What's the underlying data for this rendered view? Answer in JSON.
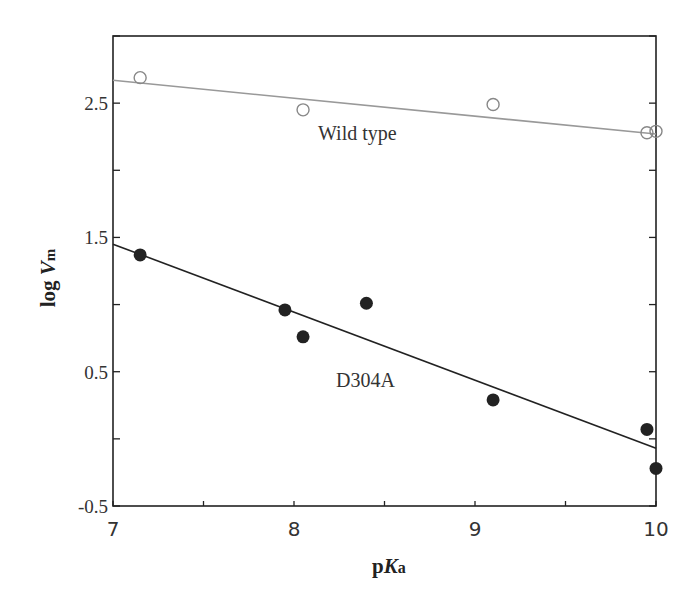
{
  "chart_data": {
    "type": "scatter",
    "title": "",
    "xlabel": "pKa",
    "ylabel": "log Vm",
    "xlim": [
      7,
      10
    ],
    "ylim": [
      -0.5,
      3.0
    ],
    "x_ticks": [
      7,
      8,
      9,
      10
    ],
    "x_tick_labels": [
      "7",
      "8",
      "9",
      "10"
    ],
    "y_ticks": [
      -0.5,
      0.5,
      1.5,
      2.5
    ],
    "y_tick_labels": [
      "-0.5",
      "0.5",
      "1.5",
      "2.5"
    ],
    "grid": false,
    "series": [
      {
        "name": "Wild type",
        "marker": "open-circle",
        "color": "#888888",
        "points": [
          [
            7.15,
            2.69
          ],
          [
            8.05,
            2.45
          ],
          [
            9.1,
            2.49
          ],
          [
            9.95,
            2.28
          ],
          [
            10.0,
            2.29
          ]
        ],
        "fit_line": [
          [
            7.0,
            2.67
          ],
          [
            10.0,
            2.27
          ]
        ]
      },
      {
        "name": "D304A",
        "marker": "filled-circle",
        "color": "#222222",
        "points": [
          [
            7.15,
            1.37
          ],
          [
            7.95,
            0.96
          ],
          [
            8.05,
            0.76
          ],
          [
            8.4,
            1.01
          ],
          [
            9.1,
            0.29
          ],
          [
            9.95,
            0.07
          ],
          [
            10.0,
            -0.22
          ]
        ],
        "fit_line": [
          [
            7.0,
            1.45
          ],
          [
            10.0,
            -0.07
          ]
        ]
      }
    ],
    "annotations": [
      {
        "text": "Wild type",
        "x": 8.3,
        "y": 2.2
      },
      {
        "text": "D304A",
        "x": 8.4,
        "y": 0.46
      }
    ]
  },
  "labels": {
    "xlabel_p": "p",
    "xlabel_K": "K",
    "xlabel_a": "a",
    "ylabel_log": "log ",
    "ylabel_V": "V",
    "ylabel_m": "m",
    "wild_type": "Wild type",
    "d304a": "D304A"
  }
}
